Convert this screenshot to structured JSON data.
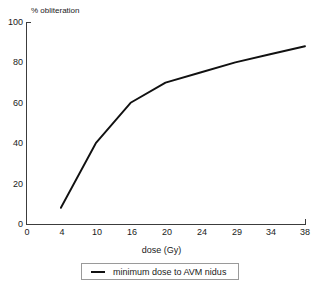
{
  "chart_data": {
    "type": "line",
    "title": "",
    "xlabel": "dose (Gy)",
    "ylabel": "% obliteration",
    "categories": [
      "0",
      "4",
      "10",
      "16",
      "20",
      "24",
      "29",
      "34",
      "38"
    ],
    "xtick_labels": [
      "0",
      "4",
      "10",
      "16",
      "20",
      "24",
      "29",
      "34",
      "38"
    ],
    "ytick_labels": [
      "0",
      "20",
      "40",
      "60",
      "80",
      "100"
    ],
    "ytick_values": [
      0,
      20,
      40,
      60,
      80,
      100
    ],
    "ylim": [
      0,
      100
    ],
    "grid": false,
    "legend_position": "below-axes",
    "series": [
      {
        "name": "minimum dose to AVM nidus",
        "x": [
          "4",
          "10",
          "16",
          "20",
          "24",
          "29",
          "34",
          "38"
        ],
        "values": [
          8,
          40,
          60,
          70,
          75,
          80,
          84,
          88
        ],
        "color": "#111111"
      }
    ]
  },
  "axes": {
    "y_title": "% obliteration",
    "x_title": "dose (Gy)",
    "y_ticks": [
      {
        "label": "100",
        "value": 100
      },
      {
        "label": "80",
        "value": 80
      },
      {
        "label": "60",
        "value": 60
      },
      {
        "label": "40",
        "value": 40
      },
      {
        "label": "20",
        "value": 20
      },
      {
        "label": "0",
        "value": 0
      }
    ],
    "x_ticks": [
      {
        "label": "0",
        "value": 0
      },
      {
        "label": "4",
        "value": 4
      },
      {
        "label": "10",
        "value": 10
      },
      {
        "label": "16",
        "value": 16
      },
      {
        "label": "20",
        "value": 20
      },
      {
        "label": "24",
        "value": 24
      },
      {
        "label": "29",
        "value": 29
      },
      {
        "label": "34",
        "value": 34
      },
      {
        "label": "38",
        "value": 38
      }
    ]
  },
  "legend": {
    "entries": [
      {
        "label": "minimum dose to AVM nidus",
        "marker": "line-marker",
        "color": "#111111"
      }
    ]
  },
  "colors": {
    "series": "#111111",
    "axis": "#3c3c3c",
    "legend_border": "#9a9a9a",
    "background": "#ffffff",
    "text": "#1a1a1a"
  }
}
